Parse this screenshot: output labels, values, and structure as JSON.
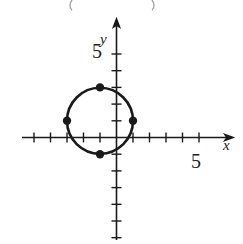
{
  "chart_data": {
    "type": "scatter",
    "title": "",
    "xlabel": "x",
    "ylabel": "y",
    "xlim": [
      -5,
      6
    ],
    "ylim": [
      -6,
      6
    ],
    "grid": false,
    "x_tick_labels": [
      {
        "value": 5,
        "label": "5"
      }
    ],
    "y_tick_labels": [
      {
        "value": 5,
        "label": "5"
      }
    ],
    "x_ticks": [
      -5,
      -4,
      -3,
      -2,
      -1,
      1,
      2,
      3,
      4,
      5
    ],
    "y_ticks": [
      -6,
      -5,
      -4,
      -3,
      -2,
      -1,
      1,
      2,
      3,
      4,
      5
    ],
    "curve": {
      "shape": "circle",
      "center": [
        -1,
        1
      ],
      "radius": 2,
      "equation": "(x+1)^2 + (y-1)^2 = 4"
    },
    "series": [
      {
        "name": "labeled points",
        "x": [
          -3,
          1,
          -1,
          -1
        ],
        "y": [
          1,
          1,
          3,
          -1
        ]
      }
    ]
  },
  "labels": {
    "x_axis": "x",
    "y_axis": "y",
    "x_tick_5": "5",
    "y_tick_5": "5"
  },
  "colors": {
    "ink": "#1a1a1a"
  }
}
